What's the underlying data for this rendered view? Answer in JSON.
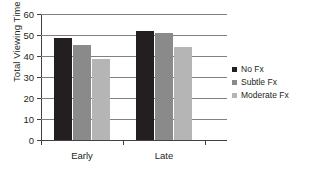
{
  "chart_data": {
    "type": "bar",
    "title": "",
    "xlabel": "",
    "ylabel": "Total Viewing Time (sec)",
    "categories": [
      "Early",
      "Late"
    ],
    "series": [
      {
        "name": "No Fx",
        "color": "#231f20",
        "values": [
          48.5,
          51.8
        ]
      },
      {
        "name": "Subtle Fx",
        "color": "#8a8a8a",
        "values": [
          45.2,
          50.8
        ]
      },
      {
        "name": "Moderate Fx",
        "color": "#b5b5b5",
        "values": [
          38.7,
          44.3
        ]
      }
    ],
    "ylim": [
      0,
      60
    ],
    "yticks": [
      0,
      10,
      20,
      30,
      40,
      50,
      60
    ],
    "ytick_labels": [
      "0",
      "10",
      "20",
      "30",
      "40",
      "50",
      "60"
    ],
    "grid": true,
    "grid_color": "#808080",
    "axis_color": "#414042",
    "legend_position": "right",
    "background": "#ffffff"
  }
}
